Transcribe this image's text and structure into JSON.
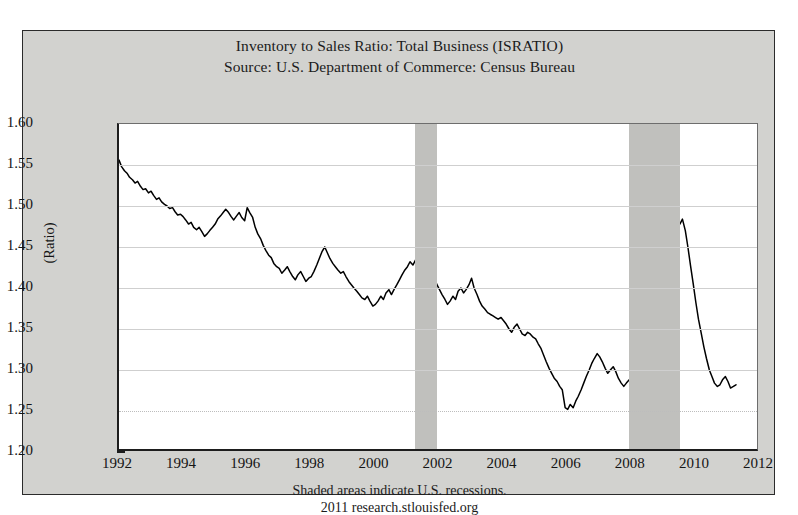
{
  "title": {
    "line1": "Inventory to Sales Ratio: Total Business (ISRATIO)",
    "line2": "Source: U.S. Department of Commerce: Census Bureau"
  },
  "footer": {
    "line1": "Shaded areas indicate U.S. recessions.",
    "line2": "2011 research.stlouisfed.org"
  },
  "axis": {
    "ylabel": "(Ratio)",
    "yticks": [
      "1.60",
      "1.55",
      "1.50",
      "1.45",
      "1.40",
      "1.35",
      "1.30",
      "1.25",
      "1.20"
    ],
    "xticks": [
      "1992",
      "1994",
      "1996",
      "1998",
      "2000",
      "2002",
      "2004",
      "2006",
      "2008",
      "2010",
      "2012"
    ]
  },
  "colors": {
    "background": "#d2d2cf",
    "plot_background": "#ffffff",
    "series": "#000000",
    "recession_shading": "#c0c0bd",
    "gridline": "#cfcfcf",
    "frame": "#1d1d1d"
  },
  "chart_data": {
    "type": "line",
    "title": "Inventory to Sales Ratio: Total Business (ISRATIO)",
    "subtitle": "Source: U.S. Department of Commerce: Census Bureau",
    "xlabel": "",
    "ylabel": "(Ratio)",
    "xlim": [
      1992.0,
      2012.0
    ],
    "ylim": [
      1.2,
      1.6
    ],
    "ytick_values": [
      1.6,
      1.55,
      1.5,
      1.45,
      1.4,
      1.35,
      1.3,
      1.25,
      1.2
    ],
    "xtick_values": [
      1992,
      1994,
      1996,
      1998,
      2000,
      2002,
      2004,
      2006,
      2008,
      2010,
      2012
    ],
    "grid": true,
    "legend": "none",
    "annotations": [
      "Shaded areas indicate U.S. recessions.",
      "2011 research.stlouisfed.org"
    ],
    "shaded_regions": [
      {
        "label": "2001 recession",
        "start": 2001.25,
        "end": 2001.92
      },
      {
        "label": "2007-2009 recession",
        "start": 2007.92,
        "end": 2009.5
      }
    ],
    "series": [
      {
        "name": "Inventory to Sales Ratio: Total Business",
        "x": [
          1992.0,
          1992.08,
          1992.17,
          1992.25,
          1992.33,
          1992.42,
          1992.5,
          1992.58,
          1992.67,
          1992.75,
          1992.83,
          1992.92,
          1993.0,
          1993.08,
          1993.17,
          1993.25,
          1993.33,
          1993.42,
          1993.5,
          1993.58,
          1993.67,
          1993.75,
          1993.83,
          1993.92,
          1994.0,
          1994.08,
          1994.17,
          1994.25,
          1994.33,
          1994.42,
          1994.5,
          1994.58,
          1994.67,
          1994.75,
          1994.83,
          1994.92,
          1995.0,
          1995.08,
          1995.17,
          1995.25,
          1995.33,
          1995.42,
          1995.5,
          1995.58,
          1995.67,
          1995.75,
          1995.83,
          1995.92,
          1996.0,
          1996.08,
          1996.17,
          1996.25,
          1996.33,
          1996.42,
          1996.5,
          1996.58,
          1996.67,
          1996.75,
          1996.83,
          1996.92,
          1997.0,
          1997.08,
          1997.17,
          1997.25,
          1997.33,
          1997.42,
          1997.5,
          1997.58,
          1997.67,
          1997.75,
          1997.83,
          1997.92,
          1998.0,
          1998.08,
          1998.17,
          1998.25,
          1998.33,
          1998.42,
          1998.5,
          1998.58,
          1998.67,
          1998.75,
          1998.83,
          1998.92,
          1999.0,
          1999.08,
          1999.17,
          1999.25,
          1999.33,
          1999.42,
          1999.5,
          1999.58,
          1999.67,
          1999.75,
          1999.83,
          1999.92,
          2000.0,
          2000.08,
          2000.17,
          2000.25,
          2000.33,
          2000.42,
          2000.5,
          2000.58,
          2000.67,
          2000.75,
          2000.83,
          2000.92,
          2001.0,
          2001.08,
          2001.17,
          2001.25,
          2001.33,
          2001.42,
          2001.5,
          2001.58,
          2001.67,
          2001.75,
          2001.83,
          2001.92,
          2002.0,
          2002.08,
          2002.17,
          2002.25,
          2002.33,
          2002.42,
          2002.5,
          2002.58,
          2002.67,
          2002.75,
          2002.83,
          2002.92,
          2003.0,
          2003.08,
          2003.17,
          2003.25,
          2003.33,
          2003.42,
          2003.5,
          2003.58,
          2003.67,
          2003.75,
          2003.83,
          2003.92,
          2004.0,
          2004.08,
          2004.17,
          2004.25,
          2004.33,
          2004.42,
          2004.5,
          2004.58,
          2004.67,
          2004.75,
          2004.83,
          2004.92,
          2005.0,
          2005.08,
          2005.17,
          2005.25,
          2005.33,
          2005.42,
          2005.5,
          2005.58,
          2005.67,
          2005.75,
          2005.83,
          2005.92,
          2006.0,
          2006.08,
          2006.17,
          2006.25,
          2006.33,
          2006.42,
          2006.5,
          2006.58,
          2006.67,
          2006.75,
          2006.83,
          2006.92,
          2007.0,
          2007.08,
          2007.17,
          2007.25,
          2007.33,
          2007.42,
          2007.5,
          2007.58,
          2007.67,
          2007.75,
          2007.83,
          2007.92,
          2008.0,
          2008.08,
          2008.17,
          2008.25,
          2008.33,
          2008.42,
          2008.5,
          2008.58,
          2008.67,
          2008.75,
          2008.83,
          2008.92,
          2009.0,
          2009.08,
          2009.17,
          2009.25,
          2009.33,
          2009.42,
          2009.5,
          2009.58,
          2009.67,
          2009.75,
          2009.83,
          2009.92,
          2010.0,
          2010.08,
          2010.17,
          2010.25,
          2010.33,
          2010.42,
          2010.5,
          2010.58,
          2010.67,
          2010.75,
          2010.83,
          2010.92,
          2011.0,
          2011.08,
          2011.17,
          2011.25
        ],
        "y": [
          1.556,
          1.548,
          1.543,
          1.54,
          1.535,
          1.532,
          1.528,
          1.53,
          1.524,
          1.52,
          1.521,
          1.516,
          1.518,
          1.513,
          1.508,
          1.51,
          1.505,
          1.502,
          1.5,
          1.497,
          1.498,
          1.493,
          1.489,
          1.49,
          1.487,
          1.483,
          1.478,
          1.48,
          1.474,
          1.471,
          1.474,
          1.469,
          1.463,
          1.466,
          1.47,
          1.474,
          1.478,
          1.484,
          1.488,
          1.492,
          1.496,
          1.492,
          1.487,
          1.483,
          1.488,
          1.492,
          1.486,
          1.482,
          1.498,
          1.492,
          1.486,
          1.474,
          1.466,
          1.46,
          1.452,
          1.446,
          1.44,
          1.437,
          1.43,
          1.426,
          1.424,
          1.418,
          1.422,
          1.426,
          1.42,
          1.414,
          1.41,
          1.416,
          1.42,
          1.414,
          1.408,
          1.412,
          1.414,
          1.42,
          1.428,
          1.436,
          1.444,
          1.45,
          1.443,
          1.436,
          1.43,
          1.426,
          1.422,
          1.418,
          1.42,
          1.414,
          1.408,
          1.404,
          1.4,
          1.396,
          1.392,
          1.388,
          1.386,
          1.39,
          1.384,
          1.378,
          1.38,
          1.384,
          1.39,
          1.386,
          1.394,
          1.398,
          1.392,
          1.398,
          1.404,
          1.41,
          1.416,
          1.422,
          1.426,
          1.432,
          1.428,
          1.434,
          1.44,
          1.436,
          1.442,
          1.438,
          1.432,
          1.424,
          1.414,
          1.404,
          1.398,
          1.392,
          1.386,
          1.38,
          1.384,
          1.39,
          1.386,
          1.396,
          1.4,
          1.394,
          1.398,
          1.404,
          1.412,
          1.4,
          1.392,
          1.384,
          1.378,
          1.374,
          1.37,
          1.368,
          1.366,
          1.364,
          1.362,
          1.364,
          1.36,
          1.356,
          1.35,
          1.346,
          1.352,
          1.356,
          1.35,
          1.344,
          1.342,
          1.346,
          1.344,
          1.34,
          1.338,
          1.332,
          1.326,
          1.318,
          1.31,
          1.302,
          1.296,
          1.29,
          1.286,
          1.28,
          1.276,
          1.254,
          1.252,
          1.258,
          1.254,
          1.262,
          1.268,
          1.276,
          1.284,
          1.292,
          1.3,
          1.308,
          1.314,
          1.32,
          1.316,
          1.31,
          1.302,
          1.296,
          1.3,
          1.304,
          1.298,
          1.29,
          1.284,
          1.28,
          1.284,
          1.288,
          1.284,
          1.278,
          1.272,
          1.278,
          1.284,
          1.28,
          1.274,
          1.268,
          1.272,
          1.29,
          1.32,
          1.36,
          1.4,
          1.43,
          1.455,
          1.47,
          1.482,
          1.488,
          1.478,
          1.484,
          1.47,
          1.45,
          1.428,
          1.404,
          1.382,
          1.362,
          1.344,
          1.328,
          1.314,
          1.3,
          1.292,
          1.284,
          1.28,
          1.282,
          1.288,
          1.292,
          1.286,
          1.278,
          1.28,
          1.282
        ]
      }
    ]
  }
}
